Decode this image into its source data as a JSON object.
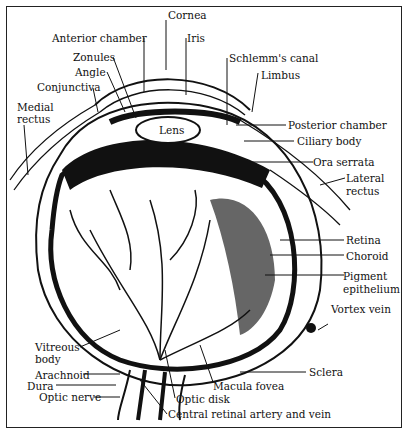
{
  "figure": {
    "labels": {
      "cornea": "Cornea",
      "anterior_chamber": "Anterior chamber",
      "iris": "Iris",
      "zonules": "Zonules",
      "schlemms_canal": "Schlemm's canal",
      "angle": "Angle",
      "limbus": "Limbus",
      "conjunctiva": "Conjunctiva",
      "medial_rectus_1": "Medial",
      "medial_rectus_2": "rectus",
      "lens": "Lens",
      "posterior_chamber": "Posterior chamber",
      "ciliary_body": "Ciliary body",
      "ora_serrata": "Ora serrata",
      "lateral_rectus_1": "Lateral",
      "lateral_rectus_2": "rectus",
      "retina": "Retina",
      "choroid": "Choroid",
      "pigment_epithelium_1": "Pigment",
      "pigment_epithelium_2": "epithelium",
      "vortex_vein": "Vortex vein",
      "vitreous_body_1": "Vitreous",
      "vitreous_body_2": "body",
      "sclera": "Sclera",
      "arachnoid": "Arachnoid",
      "dura": "Dura",
      "macula_fovea": "Macula fovea",
      "optic_nerve": "Optic nerve",
      "optic_disk": "Optic disk",
      "central_retinal": "Central retinal artery and vein"
    }
  }
}
